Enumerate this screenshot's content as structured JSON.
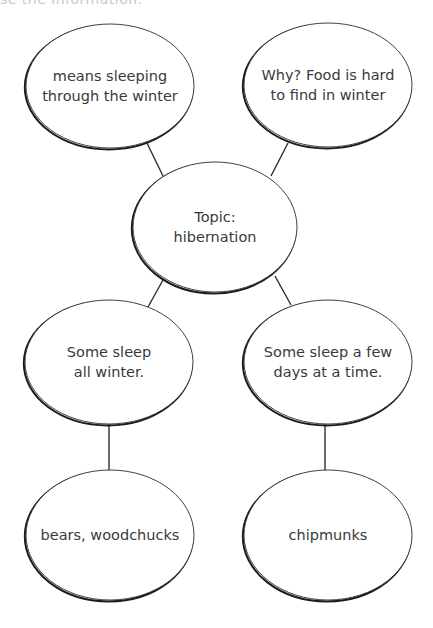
{
  "header": {
    "cropped_text": "se the information."
  },
  "diagram": {
    "colors": {
      "stroke": "#2e2e2e",
      "shadow": "#1c1c1c",
      "fill": "#ffffff",
      "text": "#3a3a3a"
    },
    "nodes": [
      {
        "id": "top-left",
        "lines": [
          "means sleeping",
          "through the winter"
        ],
        "cx": 110,
        "cy": 86,
        "rx": 84,
        "ry": 62
      },
      {
        "id": "top-right",
        "lines": [
          "Why? Food is hard",
          "to find in winter"
        ],
        "cx": 328,
        "cy": 85,
        "rx": 84,
        "ry": 62
      },
      {
        "id": "center",
        "lines": [
          "Topic:",
          "hibernation"
        ],
        "cx": 215,
        "cy": 227,
        "rx": 82,
        "ry": 65
      },
      {
        "id": "mid-left",
        "lines": [
          "Some sleep",
          "all winter."
        ],
        "cx": 109,
        "cy": 362,
        "rx": 84,
        "ry": 62
      },
      {
        "id": "mid-right",
        "lines": [
          "Some sleep a few",
          "days at a time."
        ],
        "cx": 328,
        "cy": 362,
        "rx": 84,
        "ry": 62
      },
      {
        "id": "bottom-left",
        "lines": [
          "bears, woodchucks"
        ],
        "cx": 110,
        "cy": 535,
        "rx": 84,
        "ry": 65
      },
      {
        "id": "bottom-right",
        "lines": [
          "chipmunks"
        ],
        "cx": 328,
        "cy": 535,
        "rx": 84,
        "ry": 65
      }
    ],
    "edges": [
      {
        "from": "top-left",
        "to": "center",
        "x1": 146,
        "y1": 141,
        "x2": 163,
        "y2": 176
      },
      {
        "from": "top-right",
        "to": "center",
        "x1": 288,
        "y1": 143,
        "x2": 271,
        "y2": 176
      },
      {
        "from": "center",
        "to": "mid-left",
        "x1": 163,
        "y1": 280,
        "x2": 148,
        "y2": 307
      },
      {
        "from": "center",
        "to": "mid-right",
        "x1": 275,
        "y1": 276,
        "x2": 291,
        "y2": 305
      },
      {
        "from": "mid-left",
        "to": "bottom-left",
        "x1": 109,
        "y1": 424,
        "x2": 109,
        "y2": 470
      },
      {
        "from": "mid-right",
        "to": "bottom-right",
        "x1": 325,
        "y1": 424,
        "x2": 325,
        "y2": 470
      }
    ]
  }
}
